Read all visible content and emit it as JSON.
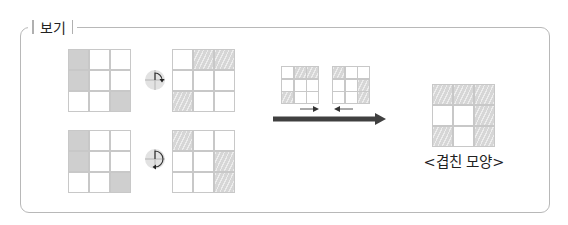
{
  "box": {
    "legend_label": "보기"
  },
  "rows": [
    {
      "original": [
        [
          "solid",
          "empty",
          "empty"
        ],
        [
          "solid",
          "empty",
          "empty"
        ],
        [
          "empty",
          "empty",
          "solid"
        ]
      ],
      "rotation_icon": "rotate-clockwise-90-icon",
      "rotated": [
        [
          "empty",
          "hatch",
          "hatch"
        ],
        [
          "empty",
          "empty",
          "empty"
        ],
        [
          "hatch",
          "empty",
          "empty"
        ]
      ]
    },
    {
      "original": [
        [
          "solid",
          "empty",
          "empty"
        ],
        [
          "solid",
          "empty",
          "empty"
        ],
        [
          "empty",
          "empty",
          "solid"
        ]
      ],
      "rotation_icon": "rotate-clockwise-180-icon",
      "rotated": [
        [
          "hatch",
          "empty",
          "empty"
        ],
        [
          "empty",
          "empty",
          "hatch"
        ],
        [
          "empty",
          "empty",
          "hatch"
        ]
      ]
    }
  ],
  "overlap_step": {
    "left_grid": [
      [
        "empty",
        "hatch",
        "hatch"
      ],
      [
        "empty",
        "empty",
        "empty"
      ],
      [
        "hatch",
        "empty",
        "empty"
      ]
    ],
    "right_grid": [
      [
        "hatch",
        "empty",
        "empty"
      ],
      [
        "empty",
        "empty",
        "hatch"
      ],
      [
        "empty",
        "empty",
        "hatch"
      ]
    ],
    "left_arrow_icon": "arrow-right-icon",
    "right_arrow_icon": "arrow-left-icon",
    "main_arrow_icon": "thick-arrow-right-icon"
  },
  "result": {
    "grid": [
      [
        "hatch",
        "hatch",
        "hatch"
      ],
      [
        "empty",
        "empty",
        "hatch"
      ],
      [
        "hatch",
        "empty",
        "hatch"
      ]
    ],
    "caption": "<겹친 모양>"
  },
  "colors": {
    "border": "#b8b8b8",
    "solid_fill": "#cfcfcf",
    "hatch_fill": "#d6d6d6",
    "arrow": "#404040"
  }
}
